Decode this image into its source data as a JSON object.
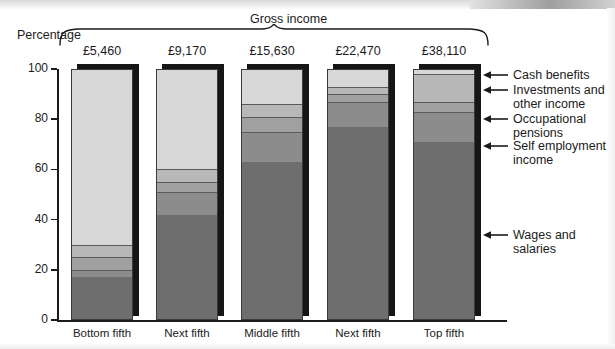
{
  "chart_data": {
    "type": "bar",
    "title": "Gross income",
    "subtitle": "",
    "ylabel": "Percentage",
    "xlabel": "",
    "ylim": [
      0,
      100
    ],
    "yticks": [
      0,
      20,
      40,
      60,
      80,
      100
    ],
    "ytick_labels": [
      "0",
      "20",
      "40",
      "60",
      "80",
      "100"
    ],
    "grid": false,
    "stacked": true,
    "legend_position": "right",
    "categories": [
      "Bottom fifth",
      "Next fifth",
      "Middle fifth",
      "Next fifth",
      "Top fifth"
    ],
    "group_labels": [
      "£5,460",
      "£9,170",
      "£15,630",
      "£22,470",
      "£38,110"
    ],
    "series": [
      {
        "name": "Wages and salaries",
        "color": "#6e6e6e",
        "values": [
          17,
          42,
          63,
          77,
          71
        ]
      },
      {
        "name": "Self employment income",
        "color": "#8c8c8c",
        "values": [
          3,
          9,
          12,
          10,
          12
        ]
      },
      {
        "name": "Occupational pensions",
        "color": "#a0a0a0",
        "values": [
          5,
          4,
          6,
          3,
          4
        ]
      },
      {
        "name": "Investments and other income",
        "color": "#b8b8b8",
        "values": [
          5,
          5,
          5,
          3,
          11
        ]
      },
      {
        "name": "Cash benefits",
        "color": "#d7d7d7",
        "values": [
          70,
          40,
          14,
          7,
          2
        ]
      }
    ]
  },
  "axis": {
    "y_title": "Percentage"
  },
  "legend": {
    "items": [
      {
        "label": "Cash benefits",
        "lines": [
          "Cash benefits"
        ]
      },
      {
        "label": "Investments and other income",
        "lines": [
          "Investments and",
          "other income"
        ]
      },
      {
        "label": "Occupational pensions",
        "lines": [
          "Occupational",
          "pensions"
        ]
      },
      {
        "label": "Self employment income",
        "lines": [
          "Self employment",
          "income"
        ]
      },
      {
        "label": "Wages and salaries",
        "lines": [
          "Wages and",
          "salaries"
        ]
      }
    ]
  }
}
